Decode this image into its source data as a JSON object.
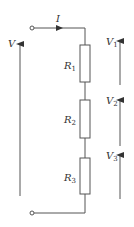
{
  "diagram": {
    "type": "series-resistor-circuit",
    "stroke_color": "#555555",
    "text_color": "#333333",
    "current": {
      "label": "I"
    },
    "supply_voltage": {
      "label": "V"
    },
    "resistors": [
      {
        "id": "R1",
        "label": "R",
        "sub": "1",
        "voltage_label": "V",
        "voltage_sub": "1"
      },
      {
        "id": "R2",
        "label": "R",
        "sub": "2",
        "voltage_label": "V",
        "voltage_sub": "2"
      },
      {
        "id": "R3",
        "label": "R",
        "sub": "3",
        "voltage_label": "V",
        "voltage_sub": "3"
      }
    ]
  }
}
